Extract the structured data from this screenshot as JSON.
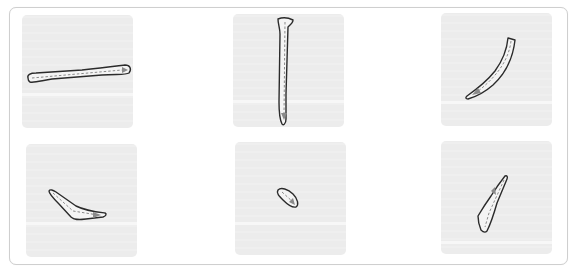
{
  "panel": {
    "border_color": "#cfcfcf",
    "background": "#ffffff"
  },
  "tiles": [
    {
      "index": 1,
      "stroke": "horizontal-stroke",
      "direction": "left-to-right"
    },
    {
      "index": 2,
      "stroke": "vertical-stroke",
      "direction": "top-to-bottom"
    },
    {
      "index": 3,
      "stroke": "left-falling-stroke",
      "direction": "top-right-to-bottom-left"
    },
    {
      "index": 4,
      "stroke": "right-falling-short-stroke",
      "direction": "top-left-to-bottom-right"
    },
    {
      "index": 5,
      "stroke": "dot-stroke",
      "direction": "top-left-to-bottom-right"
    },
    {
      "index": 6,
      "stroke": "left-falling-short-stroke",
      "direction": "top-right-to-bottom-left"
    }
  ],
  "colors": {
    "tile_bg": "#ececec",
    "outline": "#2b2b2b",
    "guide": "#8a8a8a"
  }
}
